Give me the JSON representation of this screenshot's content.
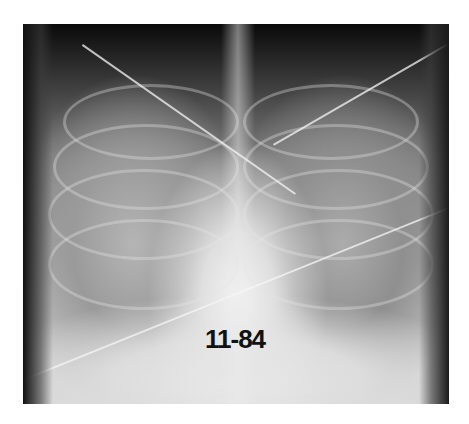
{
  "image": {
    "description": "Frontal chest radiograph with diffuse bilateral opacities, overlying lines and tubes",
    "label": "11-84",
    "colors": {
      "background": "#ffffff",
      "film_dark": "#0a0a0a",
      "film_light": "#d8d8d8",
      "label_text": "#111111"
    }
  }
}
